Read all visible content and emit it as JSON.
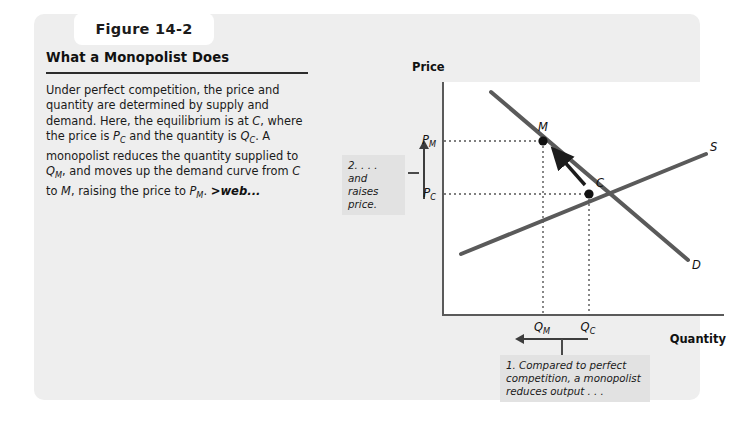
{
  "figure": {
    "number_label": "Figure 14-2",
    "heading": "What a Monopolist Does",
    "body_html": "Under perfect competition, the price and quantity are determined by supply and demand. Here, the equilibrium is at <i>C</i>, where the price is <i>P</i><span class=\"sub\">C</span> and the quantity is <i>Q</i><span class=\"sub\">C</span>. A monopolist reduces the quantity supplied to <i>Q</i><span class=\"sub\">M</span>, and moves up the demand curve from <i>C</i> to <i>M</i>, raising the price to <i>P</i><span class=\"sub\">M</span>. <span class=\"weblink\">&gt;web...</span>"
  },
  "chart_data": {
    "type": "line",
    "title": "What a Monopolist Does",
    "xlabel": "Quantity",
    "ylabel": "Price",
    "grid": false,
    "legend": "inline-curve-labels",
    "xlim": [
      0,
      1
    ],
    "ylim": [
      0,
      1
    ],
    "series": [
      {
        "name": "S",
        "label": "S",
        "description": "Supply curve, upward sloping",
        "points": [
          [
            0.18,
            0.26
          ],
          [
            0.93,
            0.7
          ]
        ]
      },
      {
        "name": "D",
        "label": "D",
        "description": "Demand curve, downward sloping",
        "points": [
          [
            0.29,
            0.96
          ],
          [
            0.86,
            0.25
          ]
        ]
      }
    ],
    "points": [
      {
        "name": "M",
        "label": "M",
        "x": 0.35,
        "y": 0.745,
        "note": "monopoly outcome"
      },
      {
        "name": "C",
        "label": "C",
        "x": 0.52,
        "y": 0.52,
        "note": "competitive equilibrium"
      }
    ],
    "y_ticks": [
      {
        "label": "P_M",
        "display": "P",
        "sub": "M",
        "value": 0.745
      },
      {
        "label": "P_C",
        "display": "P",
        "sub": "C",
        "value": 0.52
      }
    ],
    "x_ticks": [
      {
        "label": "Q_M",
        "display": "Q",
        "sub": "M",
        "value": 0.35
      },
      {
        "label": "Q_C",
        "display": "Q",
        "sub": "C",
        "value": 0.52
      }
    ],
    "annotations": [
      {
        "id": "callout-1",
        "text": "1. Compared to perfect competition, a monopolist reduces output . . .",
        "arrow": "left",
        "from": "Q_C",
        "to": "Q_M"
      },
      {
        "id": "callout-2",
        "text": "2. . . . and raises price.",
        "arrow": "up",
        "from": "P_C",
        "to": "P_M"
      },
      {
        "id": "movement-arrow",
        "description": "Thick arrow along demand curve from C up to M",
        "from": "C",
        "to": "M"
      }
    ]
  },
  "axis": {
    "price_title": "Price",
    "quantity_title": "Quantity"
  },
  "labels": {
    "p_m": "P",
    "p_m_sub": "M",
    "p_c": "P",
    "p_c_sub": "C",
    "q_m": "Q",
    "q_m_sub": "M",
    "q_c": "Q",
    "q_c_sub": "C",
    "point_m": "M",
    "point_c": "C",
    "curve_s": "S",
    "curve_d": "D"
  },
  "callouts": {
    "two": "2. . . . and raises price.",
    "one": "1. Compared to perfect competition, a monopolist reduces output . . ."
  },
  "colors": {
    "card_bg": "#eeeeee",
    "plot_bg": "#ffffff",
    "curve": "#5a5a5a",
    "axis": "#5a5a5a",
    "text": "#1a1a1a",
    "callout_bg": "#e2e2e2"
  }
}
